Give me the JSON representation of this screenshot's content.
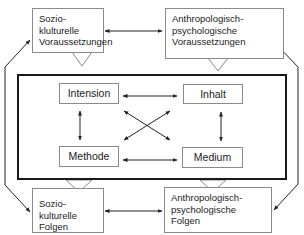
{
  "diagram": {
    "outer_boxes": {
      "top_left": {
        "lines": [
          "Sozio-klulturelle",
          "Voraussetzungen"
        ]
      },
      "top_right": {
        "lines": [
          "Anthropologisch-",
          "psychologische",
          "Voraussetzungen"
        ]
      },
      "bottom_left": {
        "lines": [
          "Sozio-kulturelle",
          "Folgen"
        ]
      },
      "bottom_right": {
        "lines": [
          "Anthropologisch-",
          "psychologische",
          "Folgen"
        ]
      }
    },
    "inner_boxes": {
      "intension": "Intension",
      "inhalt": "Inhalt",
      "methode": "Methode",
      "medium": "Medium"
    },
    "colors": {
      "frame_border": "#1a1a1a",
      "box_border": "#8a8a8a",
      "arrow": "#222222"
    }
  }
}
